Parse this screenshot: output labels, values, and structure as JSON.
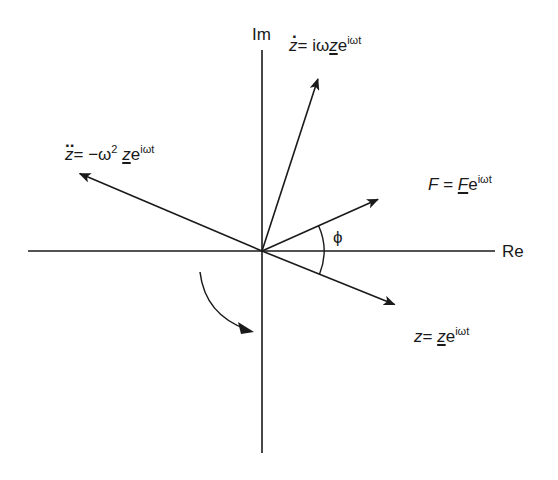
{
  "diagram": {
    "type": "phasor-diagram",
    "axes": {
      "real_label": "Re",
      "imag_label": "Im"
    },
    "angle_label": "ϕ",
    "rotation_indicator": "clockwise-arrow",
    "vectors": [
      {
        "id": "velocity",
        "lhs": "z",
        "lhs_accent": "dot",
        "rhs_text": "= iω",
        "rhs_var": "z",
        "rhs_var_underlined": true,
        "exp_base": "e",
        "exponent": "iωt",
        "angle_deg": 72
      },
      {
        "id": "acceleration",
        "lhs": "z",
        "lhs_accent": "double-dot",
        "rhs_text": "= −ω",
        "rhs_power": "2",
        "rhs_var": "z",
        "rhs_var_underlined": true,
        "exp_base": "e",
        "exponent": "iωt",
        "angle_deg": 157
      },
      {
        "id": "force",
        "lhs": "F",
        "lhs_accent": "none",
        "rhs_text": "=",
        "rhs_var": "F",
        "rhs_var_underlined": true,
        "exp_base": "e",
        "exponent": "iωt",
        "angle_deg": 24
      },
      {
        "id": "displacement",
        "lhs": "z",
        "lhs_accent": "none",
        "rhs_text": "=",
        "rhs_var": "z",
        "rhs_var_underlined": true,
        "exp_base": "e",
        "exponent": "iωt",
        "angle_deg": -22
      }
    ]
  }
}
